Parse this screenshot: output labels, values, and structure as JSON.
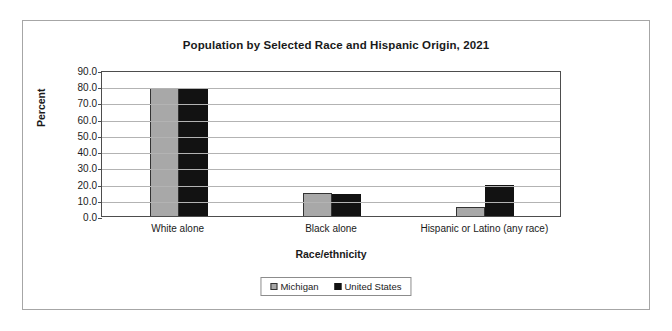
{
  "chart_data": {
    "type": "bar",
    "title": "Population by Selected Race and Hispanic Origin, 2021",
    "xlabel": "Race/ethnicity",
    "ylabel": "Percent",
    "categories": [
      "White alone",
      "Black alone",
      "Hispanic or Latino (any race)"
    ],
    "series": [
      {
        "name": "Michigan",
        "color": "#a8a8a8",
        "values": [
          78.8,
          14.1,
          5.6
        ]
      },
      {
        "name": "United States",
        "color": "#121212",
        "values": [
          78.5,
          13.6,
          19.2
        ]
      }
    ],
    "ylim": [
      0.0,
      90.0
    ],
    "ytick_step": 10.0,
    "ytick_labels": [
      "90.0",
      "80.0",
      "70.0",
      "60.0",
      "50.0",
      "40.0",
      "30.0",
      "20.0",
      "10.0",
      "0.0"
    ],
    "grid": "horizontal",
    "legend_position": "bottom"
  },
  "legend": {
    "items": [
      {
        "label": "Michigan",
        "swatch": "michigan"
      },
      {
        "label": "United States",
        "swatch": "us"
      }
    ]
  }
}
